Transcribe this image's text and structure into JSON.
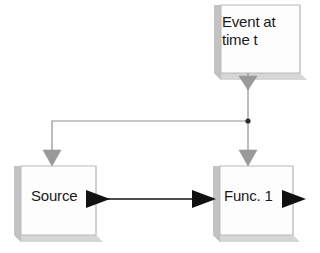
{
  "diagram": {
    "background_color": "#ffffff",
    "nodes": [
      {
        "id": "event",
        "name": "event-block",
        "label": "Event at\ntime t",
        "label_lines": [
          "Event at",
          "time t"
        ],
        "x": 214,
        "y": 5,
        "width": 86,
        "height": 68,
        "face_color": "#fdfdfd",
        "edge_color": "#b7b7b7",
        "extrude_color": "#bdbdbd",
        "shadow_color": "#cfcfcf"
      },
      {
        "id": "source",
        "name": "source-block",
        "label": "Source",
        "label_lines": [
          "Source"
        ],
        "x": 14,
        "y": 166,
        "width": 82,
        "height": 69,
        "face_color": "#fdfdfd",
        "edge_color": "#b7b7b7",
        "extrude_color": "#bdbdbd",
        "shadow_color": "#cfcfcf"
      },
      {
        "id": "func1",
        "name": "func-1-block",
        "label": "Func. 1",
        "label_lines": [
          "Func. 1"
        ],
        "x": 213,
        "y": 166,
        "width": 80,
        "height": 69,
        "face_color": "#fdfdfd",
        "edge_color": "#b7b7b7",
        "extrude_color": "#bdbdbd",
        "shadow_color": "#cfcfcf"
      }
    ],
    "connections": [
      {
        "id": "event-out",
        "name": "event-output-connector",
        "kind": "signal",
        "color": "#8f8f8f",
        "from": "event",
        "to": "junction",
        "arrowhead": "down-triangle-gray"
      },
      {
        "id": "branch-left",
        "name": "event-to-source-connector",
        "kind": "signal",
        "color": "#8f8f8f",
        "from": "junction",
        "to": "source",
        "arrowhead": "down-triangle-gray"
      },
      {
        "id": "branch-right",
        "name": "event-to-func1-connector",
        "kind": "signal",
        "color": "#8f8f8f",
        "from": "junction",
        "to": "func1",
        "arrowhead": "down-triangle-gray"
      },
      {
        "id": "source-to-func1",
        "name": "source-to-func1-dataflow",
        "kind": "data",
        "color": "#111111",
        "from": "source",
        "to": "func1",
        "arrowhead": "right-triangle-black"
      },
      {
        "id": "func1-out",
        "name": "func1-output-dataflow",
        "kind": "data",
        "color": "#111111",
        "from": "func1",
        "to": null,
        "arrowhead": "right-triangle-black"
      }
    ],
    "junction": {
      "name": "signal-junction-dot",
      "x": 248,
      "y": 121,
      "radius": 2.6,
      "color": "#2b2b2b"
    },
    "colors": {
      "signal_line": "#8f8f8f",
      "signal_arrow": "#9a9a9a",
      "data_line": "#111111",
      "data_arrow": "#111111",
      "box_face": "#fdfdfd",
      "box_edge": "#b7b7b7",
      "box_extrude": "#bdbdbd",
      "text": "#1a1a1a"
    }
  }
}
